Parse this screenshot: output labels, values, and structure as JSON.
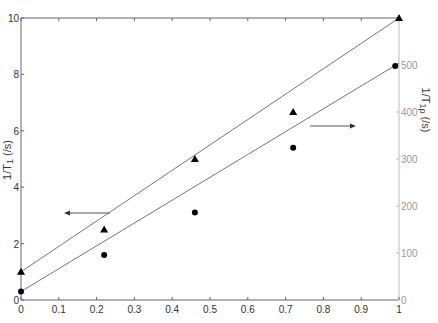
{
  "chart_data": {
    "type": "scatter",
    "title": "",
    "xlabel": "",
    "ylabel": "1/T1 (/s)",
    "ylabel_right": "1/T1ρ (/s)",
    "xlim": [
      0,
      1
    ],
    "ylim": [
      0,
      10
    ],
    "ylim_right": [
      0,
      600
    ],
    "x_ticks": [
      "0",
      "0.1",
      "0.2",
      "0.3",
      "0.4",
      "0.5",
      "0.6",
      "0.7",
      "0.8",
      "0.9",
      "1"
    ],
    "y_ticks": [
      "0",
      "2",
      "4",
      "6",
      "8",
      "10"
    ],
    "y_ticks_right": [
      "0",
      "100",
      "200",
      "300",
      "400",
      "500"
    ],
    "grid": false,
    "series": [
      {
        "name": "1/T1",
        "marker": "circle",
        "axis": "left",
        "x": [
          0,
          0.22,
          0.46,
          0.72,
          0.99
        ],
        "y": [
          0.3,
          1.6,
          3.1,
          5.4,
          8.3
        ],
        "fit_line": {
          "x": [
            0,
            1
          ],
          "y": [
            0.3,
            8.4
          ]
        }
      },
      {
        "name": "1/T1ρ",
        "marker": "triangle",
        "axis": "right",
        "x": [
          0,
          0.22,
          0.46,
          0.72,
          1.0
        ],
        "y": [
          60,
          150,
          300,
          400,
          600
        ],
        "fit_line": {
          "x": [
            0,
            1
          ],
          "y": [
            60,
            600
          ]
        }
      }
    ],
    "annotations": [
      {
        "type": "arrow",
        "direction": "left",
        "label": "points to left axis (1/T1)"
      },
      {
        "type": "arrow",
        "direction": "right",
        "label": "points to right axis (1/T1ρ)"
      }
    ]
  },
  "labels": {
    "ylabel_left": "1/T",
    "ylabel_left_sub": "1",
    "ylabel_left_unit": " (/s)",
    "ylabel_right": "1/T",
    "ylabel_right_sub": "1ρ",
    "ylabel_right_unit": " (/s)"
  }
}
